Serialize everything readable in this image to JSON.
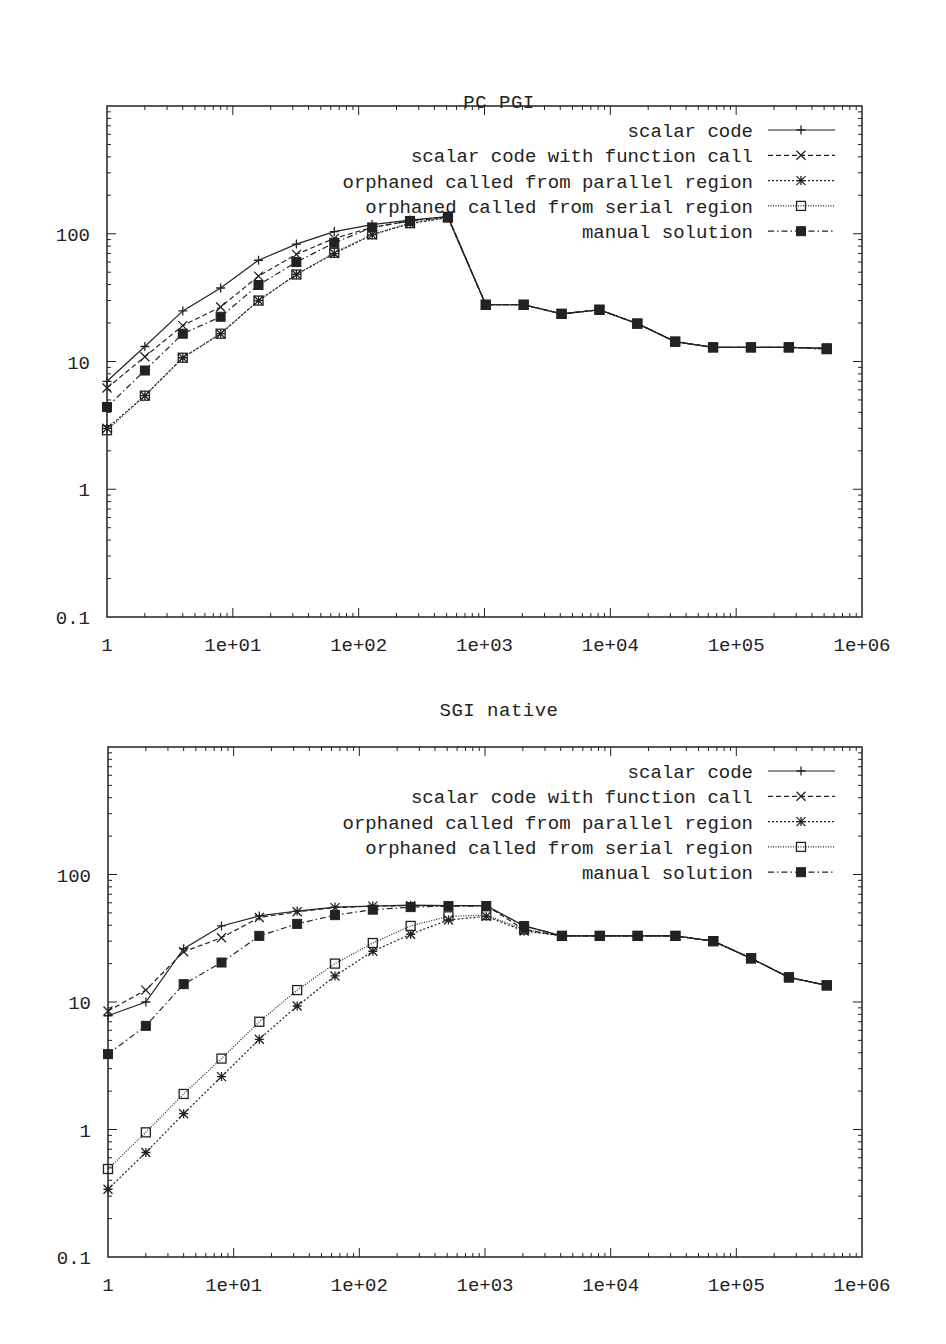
{
  "chart_data": [
    {
      "type": "line",
      "title": "PC PGI",
      "xlabel": "",
      "ylabel": "",
      "xscale": "log",
      "yscale": "log",
      "xlim": [
        1,
        1000000
      ],
      "ylim": [
        0.1,
        1000
      ],
      "grid": false,
      "legend_position": "top-right",
      "x_tick_labels": [
        "1",
        "1e+01",
        "1e+02",
        "1e+03",
        "1e+04",
        "1e+05",
        "1e+06"
      ],
      "y_tick_labels": [
        "0.1",
        "1",
        "10",
        "100"
      ],
      "x": [
        1,
        2,
        4,
        8,
        16,
        32,
        64,
        128,
        256,
        512,
        1024,
        2048,
        4096,
        8192,
        16384,
        32768,
        65536,
        131072,
        262144,
        524288
      ],
      "series": [
        {
          "name": "scalar code",
          "marker": "plus",
          "dash": "solid",
          "values": [
            7.0,
            13.1,
            24.9,
            37.6,
            62,
            83,
            104,
            118,
            128,
            136,
            27.8,
            27.8,
            23.6,
            25.4,
            19.8,
            14.3,
            12.9,
            12.9,
            12.9,
            12.7
          ]
        },
        {
          "name": "scalar code with function call",
          "marker": "cross",
          "dash": "dashed",
          "values": [
            6.2,
            10.9,
            19.1,
            26.7,
            46.6,
            69,
            92,
            112,
            126,
            136,
            27.8,
            27.8,
            23.6,
            25.4,
            19.8,
            14.3,
            12.9,
            12.9,
            12.9,
            12.7
          ]
        },
        {
          "name": "orphaned called from parallel region",
          "marker": "star",
          "dash": "dotted",
          "values": [
            3.0,
            5.4,
            10.7,
            16.5,
            30,
            48,
            70,
            98,
            120,
            134,
            27.8,
            27.8,
            23.6,
            25.4,
            19.8,
            14.3,
            12.9,
            12.9,
            12.9,
            12.5
          ]
        },
        {
          "name": "orphaned called from serial region",
          "marker": "open-square",
          "dash": "fine-dotted",
          "values": [
            2.9,
            5.4,
            10.7,
            16.5,
            30,
            48,
            71,
            99,
            121,
            134,
            27.8,
            27.8,
            23.6,
            25.4,
            19.8,
            14.3,
            12.9,
            12.9,
            12.9,
            12.5
          ]
        },
        {
          "name": "manual solution",
          "marker": "filled-square",
          "dash": "dash-dot",
          "values": [
            4.4,
            8.5,
            16.5,
            22.4,
            39.7,
            60,
            85,
            112,
            126,
            136,
            27.8,
            27.8,
            23.6,
            25.4,
            19.8,
            14.3,
            12.9,
            12.9,
            12.9,
            12.7
          ]
        }
      ]
    },
    {
      "type": "line",
      "title": "SGI native",
      "xlabel": "",
      "ylabel": "",
      "xscale": "log",
      "yscale": "log",
      "xlim": [
        1,
        1000000
      ],
      "ylim": [
        0.1,
        1000
      ],
      "grid": false,
      "legend_position": "top-right",
      "x_tick_labels": [
        "1",
        "1e+01",
        "1e+02",
        "1e+03",
        "1e+04",
        "1e+05",
        "1e+06"
      ],
      "y_tick_labels": [
        "0.1",
        "1",
        "10",
        "100"
      ],
      "x": [
        1,
        2,
        4,
        8,
        16,
        32,
        64,
        128,
        256,
        512,
        1024,
        2048,
        4096,
        8192,
        16384,
        32768,
        65536,
        131072,
        262144,
        524288
      ],
      "series": [
        {
          "name": "scalar code",
          "marker": "plus",
          "dash": "solid",
          "values": [
            7.8,
            10.0,
            26.2,
            39.5,
            47.3,
            51.7,
            55.5,
            56.5,
            57.5,
            57,
            57,
            39.5,
            33,
            33,
            33,
            33,
            30,
            22,
            15.6,
            13.5
          ]
        },
        {
          "name": "scalar code with function call",
          "marker": "cross",
          "dash": "dashed",
          "values": [
            8.5,
            12.4,
            24.8,
            31.9,
            46,
            51,
            55,
            56.5,
            57,
            57,
            57,
            37,
            33,
            33,
            33,
            33,
            30,
            22,
            15.6,
            13.5
          ]
        },
        {
          "name": "orphaned called from parallel region",
          "marker": "star",
          "dash": "dotted",
          "values": [
            0.34,
            0.66,
            1.33,
            2.6,
            5.1,
            9.3,
            16,
            25,
            34,
            44,
            47,
            36,
            33,
            33,
            33,
            33,
            30,
            22,
            15.6,
            13.5
          ]
        },
        {
          "name": "orphaned called from serial region",
          "marker": "open-square",
          "dash": "fine-dotted",
          "values": [
            0.49,
            0.95,
            1.9,
            3.6,
            7.0,
            12.4,
            20,
            29,
            39.5,
            47,
            48,
            37,
            33,
            33,
            33,
            33,
            30,
            22,
            15.6,
            13.5
          ]
        },
        {
          "name": "manual solution",
          "marker": "filled-square",
          "dash": "dash-dot",
          "values": [
            3.9,
            6.5,
            13.8,
            20.4,
            33,
            41,
            48,
            53,
            55.5,
            56.5,
            56.5,
            39.5,
            33,
            33,
            33,
            33,
            30,
            22,
            15.6,
            13.5
          ]
        }
      ]
    }
  ],
  "charts": [
    {
      "title": "PC PGI"
    },
    {
      "title": "SGI native"
    }
  ],
  "style": {
    "line_color": "#222222",
    "background": "#ffffff"
  }
}
